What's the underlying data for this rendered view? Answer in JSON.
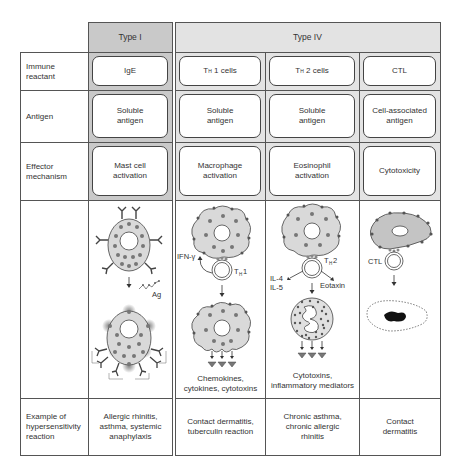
{
  "columns": {
    "type1": {
      "header": "Type I"
    },
    "type4": {
      "header": "Type IV"
    }
  },
  "rows": [
    {
      "label": "Immune\nreactant",
      "type1": "IgE",
      "th1": "Tₕ 1 cells",
      "th2": "Tₕ 2 cells",
      "ctl": "CTL"
    },
    {
      "label": "Antigen",
      "type1": "Soluble\nantigen",
      "th1": "Soluble\nantigen",
      "th2": "Soluble\nantigen",
      "ctl": "Cell-associated\nantigen"
    },
    {
      "label": "Effector\nmechanism",
      "type1": "Mast cell\nactivation",
      "th1": "Macrophage\nactivation",
      "th2": "Eosinophil\nactivation",
      "ctl": "Cytotoxicity"
    },
    {
      "label": "Example of\nhypersensitivity\nreaction",
      "type1": "Allergic rhinitis,\nasthma, systemic\nanaphylaxis",
      "th1": "Contact dermatitis,\ntuberculin reaction",
      "th2": "Chronic asthma,\nchronic allergic\nrhinitis",
      "ctl": "Contact\ndermatitis"
    }
  ],
  "illustrations": {
    "type1": {
      "antigen_label": "Ag"
    },
    "th1": {
      "cytokine_label": "IFN-γ",
      "cell_label_main": "T",
      "cell_label_sub": "H",
      "cell_label_num": "1",
      "output_label": "Chemokines,\ncytokines, cytotoxins"
    },
    "th2": {
      "cytokine_label_1": "IL-4",
      "cytokine_label_2": "IL-5",
      "chemokine_label": "Eotaxin",
      "cell_label_main": "T",
      "cell_label_sub": "H",
      "cell_label_num": "2",
      "output_label": "Cytotoxins,\ninflammatory mediators"
    },
    "ctl": {
      "cell_label": "CTL"
    }
  },
  "th_labels": {
    "th1_main": "T",
    "th1_sub": "H",
    "th1_rest": "1 cells",
    "th2_main": "T",
    "th2_sub": "H",
    "th2_rest": "2 cells"
  },
  "colors": {
    "type1_shade": "#c9c9c9",
    "type4_shade": "#e3e3e3",
    "cell_fill": "#d9d9d9",
    "granule": "#777777"
  }
}
